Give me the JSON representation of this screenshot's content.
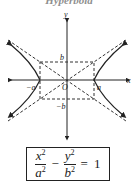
{
  "title": "Hyperbola",
  "diagram": {
    "axis_labels": {
      "x": "x",
      "y": "y"
    },
    "origin_label": "O",
    "vertex_labels": {
      "left": "−a",
      "right": "a"
    },
    "co_vertex_labels": {
      "top": "b",
      "bottom": "−b"
    }
  },
  "formula": {
    "term1_num": "x",
    "term1_den": "a",
    "term2_num": "y",
    "term2_den": "b",
    "exponent": "2",
    "minus": "−",
    "equals": "=",
    "rhs": "1"
  }
}
